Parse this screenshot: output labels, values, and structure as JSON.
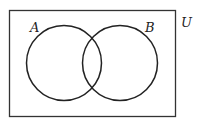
{
  "diagram": {
    "type": "venn",
    "universe_label": "U",
    "sets": [
      {
        "label": "A"
      },
      {
        "label": "B"
      }
    ],
    "colors": {
      "stroke": "#222222",
      "background": "#ffffff"
    }
  }
}
